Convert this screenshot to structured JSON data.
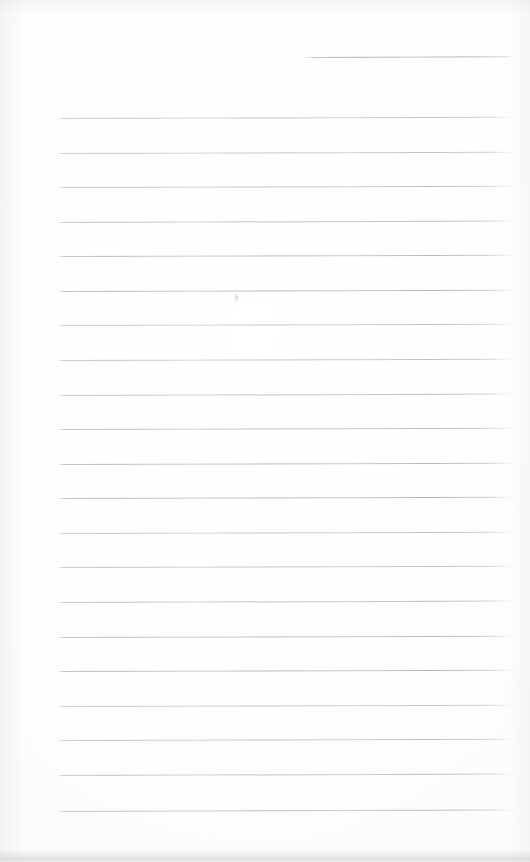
{
  "document": {
    "kind": "scanned-lined-notebook-page",
    "title": "Blank ruled notebook page (scan)",
    "width": 530,
    "height": 862,
    "content_text": "",
    "handwriting_present": "no",
    "page_number_text": ""
  },
  "colors": {
    "page_background": "#fdfdfd",
    "paper_white": "#ffffff",
    "rule_line": "#b0b4ba",
    "rule_line_light": "#c2c6cc",
    "edge_shadow": "#c8cace",
    "bottom_band": "#c6c8cd",
    "smudge": "#96989e"
  },
  "ruling": {
    "style": "wide-ruled horizontal lines",
    "line_count": 21,
    "line_spacing_px": 34.6,
    "first_line_y": 118,
    "last_line_y": 811,
    "line_left_x": 57,
    "line_right_x": 513,
    "line_thickness_px": 1,
    "line_tilt_deg": -0.16,
    "margin_rule_present": "no"
  },
  "partial_rule": {
    "label": "short-top-rule",
    "x": 302,
    "y": 57,
    "width": 212,
    "tilt_deg": -0.22
  },
  "rules": [
    {
      "y": 118.0,
      "x": 57,
      "width": 456,
      "tilt": -0.16
    },
    {
      "y": 152.5,
      "x": 57,
      "width": 456,
      "tilt": -0.17
    },
    {
      "y": 187.1,
      "x": 57,
      "width": 456,
      "tilt": -0.15
    },
    {
      "y": 221.7,
      "x": 57,
      "width": 456,
      "tilt": -0.18
    },
    {
      "y": 256.3,
      "x": 57,
      "width": 456,
      "tilt": -0.16
    },
    {
      "y": 290.8,
      "x": 57,
      "width": 456,
      "tilt": -0.15
    },
    {
      "y": 325.4,
      "x": 57,
      "width": 456,
      "tilt": -0.17
    },
    {
      "y": 360.0,
      "x": 57,
      "width": 456,
      "tilt": -0.16
    },
    {
      "y": 394.6,
      "x": 57,
      "width": 456,
      "tilt": -0.18
    },
    {
      "y": 429.1,
      "x": 57,
      "width": 456,
      "tilt": -0.15
    },
    {
      "y": 463.7,
      "x": 57,
      "width": 456,
      "tilt": -0.16
    },
    {
      "y": 498.3,
      "x": 57,
      "width": 456,
      "tilt": -0.17
    },
    {
      "y": 532.9,
      "x": 57,
      "width": 456,
      "tilt": -0.16
    },
    {
      "y": 567.4,
      "x": 57,
      "width": 456,
      "tilt": -0.15
    },
    {
      "y": 602.0,
      "x": 57,
      "width": 456,
      "tilt": -0.18
    },
    {
      "y": 636.6,
      "x": 57,
      "width": 456,
      "tilt": -0.16
    },
    {
      "y": 671.2,
      "x": 57,
      "width": 456,
      "tilt": -0.17
    },
    {
      "y": 705.7,
      "x": 57,
      "width": 456,
      "tilt": -0.16
    },
    {
      "y": 740.3,
      "x": 57,
      "width": 456,
      "tilt": -0.15
    },
    {
      "y": 774.9,
      "x": 57,
      "width": 456,
      "tilt": -0.18
    },
    {
      "y": 811.0,
      "x": 57,
      "width": 456,
      "tilt": -0.19
    }
  ],
  "marks": [
    {
      "label": "pencil-smudge",
      "x": 234,
      "y": 293,
      "width": 5,
      "height": 9
    }
  ],
  "bottom_band": {
    "label": "scan-edge-band",
    "y": 850,
    "height": 12
  }
}
